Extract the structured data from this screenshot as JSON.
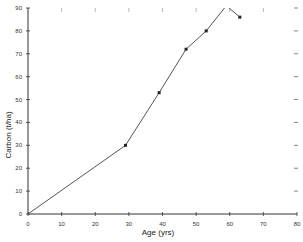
{
  "chart_data": {
    "type": "line",
    "title": "",
    "xlabel": "Age (yrs)",
    "ylabel": "Carbon (t/ha)",
    "xlim": [
      0,
      80
    ],
    "ylim": [
      0,
      90
    ],
    "xticks": [
      0,
      10,
      20,
      30,
      40,
      50,
      60,
      70,
      80
    ],
    "yticks": [
      0,
      10,
      20,
      30,
      40,
      50,
      60,
      70,
      80,
      90
    ],
    "grid": false,
    "legend": null,
    "series": [
      {
        "name": "Carbon",
        "x": [
          0,
          29,
          39,
          47,
          53,
          59,
          63
        ],
        "y": [
          0,
          30,
          53,
          72,
          80,
          91,
          86
        ],
        "marker": "small-square"
      }
    ],
    "colors": {
      "line": "#555555",
      "axis": "#333333",
      "marker": "#222222"
    }
  }
}
